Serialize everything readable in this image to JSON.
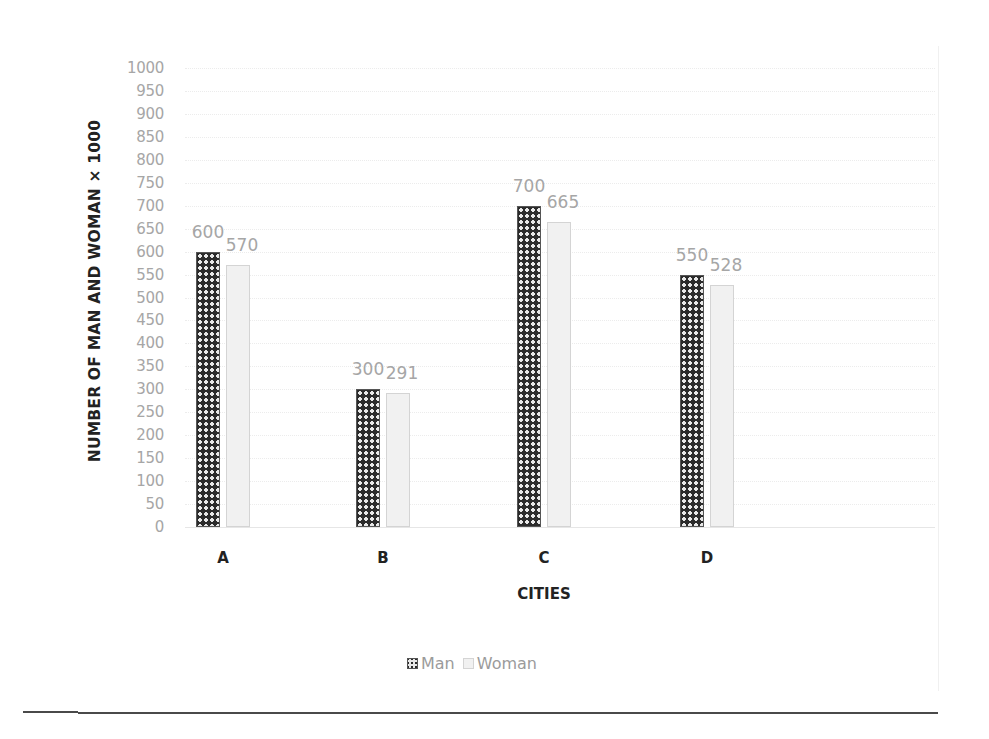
{
  "chart_data": {
    "type": "bar",
    "title": "",
    "xlabel": "CITIES",
    "ylabel": "NUMBER OF MAN AND WOMAN × 1000",
    "categories": [
      "A",
      "B",
      "C",
      "D"
    ],
    "series": [
      {
        "name": "Man",
        "values": [
          600,
          300,
          700,
          550
        ],
        "pattern": "dark-crosshatch",
        "color": "#2b2b2b"
      },
      {
        "name": "Woman",
        "values": [
          570,
          291,
          665,
          528
        ],
        "pattern": "light-fill",
        "color": "#f1f1f1"
      }
    ],
    "data_labels": {
      "Man": [
        "600",
        "300",
        "700",
        "550"
      ],
      "Woman": [
        "570",
        "291",
        "665",
        "528"
      ]
    },
    "ylim": [
      0,
      1000
    ],
    "ytick_step": 50,
    "yticks": [
      "0",
      "50",
      "100",
      "150",
      "200",
      "250",
      "300",
      "350",
      "400",
      "450",
      "500",
      "550",
      "600",
      "650",
      "700",
      "750",
      "800",
      "850",
      "900",
      "950",
      "1000"
    ],
    "grid": true,
    "legend_position": "bottom",
    "legend": [
      "Man",
      "Woman"
    ]
  }
}
